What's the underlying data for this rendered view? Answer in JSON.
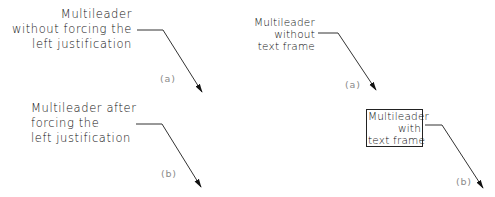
{
  "diagram": {
    "stroke_color": "#222222",
    "label_color": "#8a8a8a",
    "examples": [
      {
        "id": "left-a",
        "lines": [
          "Multileader",
          "without forcing the",
          "left justification"
        ],
        "label": "(a)",
        "alignment": "right",
        "frame": false
      },
      {
        "id": "left-b",
        "lines": [
          "Multileader after",
          "forcing the",
          "left justification"
        ],
        "label": "(b)",
        "alignment": "left",
        "frame": false
      },
      {
        "id": "right-a",
        "lines": [
          "Multileader",
          "without",
          "text frame"
        ],
        "label": "(a)",
        "alignment": "right",
        "frame": false
      },
      {
        "id": "right-b",
        "lines": [
          "Multileader",
          "with",
          "text frame"
        ],
        "label": "(b)",
        "alignment": "right",
        "frame": true
      }
    ]
  }
}
